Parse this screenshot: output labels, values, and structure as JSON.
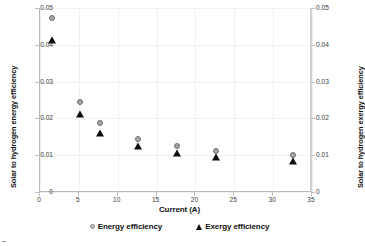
{
  "chart_data": {
    "type": "scatter",
    "title": "",
    "xlabel": "Current (A)",
    "ylabel": "Solar to hydrogen energy efficiency",
    "y2label": "Solar to hydrogen exergy efficiency",
    "xlim": [
      0,
      35
    ],
    "ylim": [
      0,
      0.05
    ],
    "y2lim": [
      0,
      0.05
    ],
    "xticks": [
      "0",
      "5",
      "10",
      "15",
      "20",
      "25",
      "30",
      "35"
    ],
    "xtick_values": [
      0,
      5,
      10,
      15,
      20,
      25,
      30,
      35
    ],
    "yticks": [
      "0",
      "0.01",
      "0.02",
      "0.03",
      "0.04",
      "0.05"
    ],
    "ytick_values": [
      0,
      0.01,
      0.02,
      0.03,
      0.04,
      0.05
    ],
    "y2ticks": [
      "0",
      "0.01",
      "0.02",
      "0.03",
      "0.04",
      "0.05"
    ],
    "y2tick_values": [
      0,
      0.01,
      0.02,
      0.03,
      0.04,
      0.05
    ],
    "grid": true,
    "legend_position": "bottom",
    "x": [
      1.5,
      5.2,
      7.7,
      12.6,
      17.6,
      22.6,
      32.6
    ],
    "series": [
      {
        "name": "Energy efficiency",
        "marker": "circle",
        "color": "#a6a6a6",
        "edge_color": "#6e6e6e",
        "axis": "left",
        "values": [
          0.0472,
          0.0245,
          0.0187,
          0.0143,
          0.0124,
          0.0112,
          0.01
        ]
      },
      {
        "name": "Exergy efficiency",
        "marker": "triangle",
        "color": "#0d0d0d",
        "edge_color": "#0d0d0d",
        "axis": "right",
        "values": [
          0.0412,
          0.0213,
          0.0161,
          0.0124,
          0.0105,
          0.0096,
          0.0085
        ]
      }
    ]
  },
  "legend": {
    "items": [
      {
        "label": "Energy efficiency",
        "marker": "circle"
      },
      {
        "label": "Exergy efficiency",
        "marker": "triangle"
      }
    ]
  }
}
